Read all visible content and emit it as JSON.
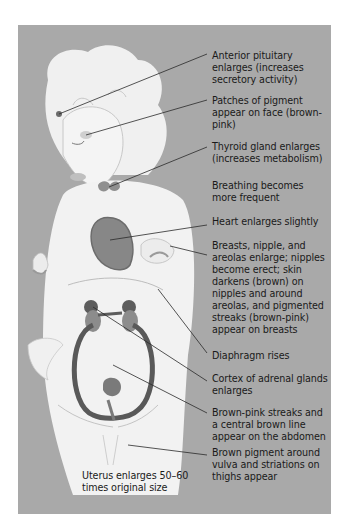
{
  "figure": {
    "background_color": "#a9a9a9",
    "body_color": "#f2f2f2",
    "organ_color": "#7d7d7d",
    "uterus_color": "#555555",
    "leader_line_color": "#2a2a2a"
  },
  "labels": [
    {
      "id": "anterior-pituitary",
      "text": "Anterior pituitary\nenlarges (increases\nsecretory activity)"
    },
    {
      "id": "face-pigment",
      "text": "Patches of pigment\nappear on face (brown-\npink)"
    },
    {
      "id": "thyroid",
      "text": "Thyroid gland enlarges\n(increases metabolism)"
    },
    {
      "id": "breathing",
      "text": "Breathing becomes\nmore frequent"
    },
    {
      "id": "heart",
      "text": "Heart enlarges slightly"
    },
    {
      "id": "breasts",
      "text": "Breasts, nipple, and\nareolas enlarge; nipples\nbecome erect; skin\ndarkens (brown) on\nnipples and around\nareolas, and pigmented\nstreaks (brown-pink)\nappear on breasts"
    },
    {
      "id": "diaphragm",
      "text": "Diaphragm rises"
    },
    {
      "id": "adrenal",
      "text": "Cortex of adrenal glands\nenlarges"
    },
    {
      "id": "abdomen-streaks",
      "text": "Brown-pink streaks and\na central brown line\nappear on the abdomen"
    },
    {
      "id": "vulva-pigment",
      "text": "Brown pigment around\nvulva and striations on\nthighs appear"
    },
    {
      "id": "uterus",
      "text": "Uterus enlarges 50–60\ntimes original size"
    }
  ]
}
